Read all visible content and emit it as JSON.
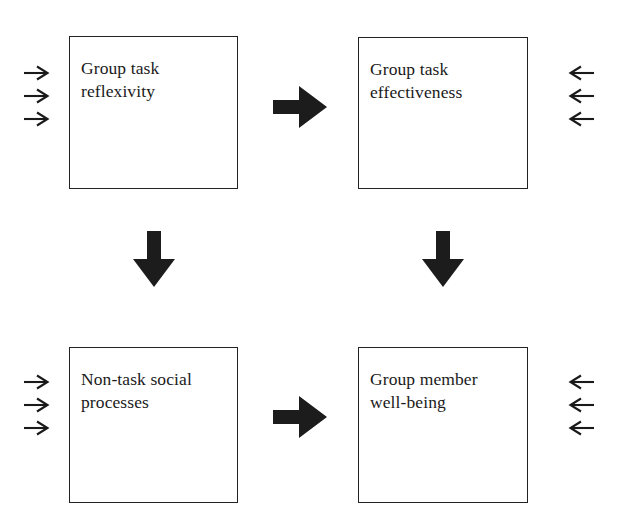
{
  "diagram": {
    "background_color": "#ffffff",
    "stroke_color": "#222222",
    "arrow_fill": "#1c1c1c",
    "nodes": [
      {
        "id": "group-task-reflexivity",
        "label": "Group task\nreflexivity",
        "line1": "Group task",
        "line2": "reflexivity",
        "x": 69,
        "y": 36,
        "w": 169,
        "h": 153
      },
      {
        "id": "group-task-effectiveness",
        "label": "Group task\neffectiveness",
        "line1": "Group task",
        "line2": "effectiveness",
        "x": 358,
        "y": 37,
        "w": 170,
        "h": 152
      },
      {
        "id": "non-task-social-processes",
        "label": "Non-task social\nprocesses",
        "line1": "Non-task social",
        "line2": "processes",
        "x": 69,
        "y": 347,
        "w": 169,
        "h": 156
      },
      {
        "id": "group-member-well-being",
        "label": "Group member\nwell-being",
        "line1": "Group member",
        "line2": "well-being",
        "x": 358,
        "y": 347,
        "w": 170,
        "h": 156
      }
    ],
    "thick_arrows": [
      {
        "id": "reflexivity-to-effectiveness",
        "direction": "right",
        "from": "group-task-reflexivity",
        "to": "group-task-effectiveness"
      },
      {
        "id": "social-processes-to-well-being",
        "direction": "right",
        "from": "non-task-social-processes",
        "to": "group-member-well-being"
      },
      {
        "id": "reflexivity-to-social-processes",
        "direction": "down",
        "from": "group-task-reflexivity",
        "to": "non-task-social-processes"
      },
      {
        "id": "effectiveness-to-well-being",
        "direction": "down",
        "from": "group-task-effectiveness",
        "to": "group-member-well-being"
      }
    ],
    "thin_arrow_groups": [
      {
        "id": "inputs-to-reflexivity",
        "direction": "right",
        "count": 3,
        "target": "group-task-reflexivity"
      },
      {
        "id": "outputs-from-effectiveness",
        "direction": "left",
        "count": 3,
        "target": "group-task-effectiveness"
      },
      {
        "id": "inputs-to-social-processes",
        "direction": "right",
        "count": 3,
        "target": "non-task-social-processes"
      },
      {
        "id": "outputs-from-well-being",
        "direction": "left",
        "count": 3,
        "target": "group-member-well-being"
      }
    ]
  }
}
